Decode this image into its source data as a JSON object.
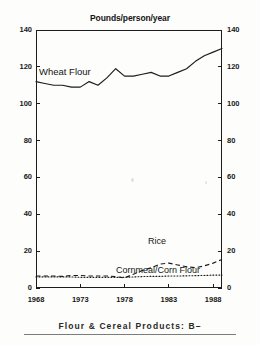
{
  "chart_data": {
    "type": "line",
    "title": "Pounds/person/year",
    "xlabel": "",
    "ylabel": "",
    "xlim": [
      1968,
      1989
    ],
    "ylim": [
      0,
      140
    ],
    "grid": false,
    "legend_position": "inline-annotations",
    "x_ticks": [
      "1968",
      "1973",
      "1978",
      "1983",
      "1988"
    ],
    "x_tick_values": [
      1968,
      1973,
      1978,
      1983,
      1988
    ],
    "y_ticks": [
      "0",
      "20",
      "40",
      "60",
      "80",
      "100",
      "120",
      "140"
    ],
    "y_tick_values": [
      0,
      20,
      40,
      60,
      80,
      100,
      120,
      140
    ],
    "y_axis_duplicated_right": true,
    "x": [
      1968,
      1969,
      1970,
      1971,
      1972,
      1973,
      1974,
      1975,
      1976,
      1977,
      1978,
      1979,
      1980,
      1981,
      1982,
      1983,
      1984,
      1985,
      1986,
      1987,
      1988,
      1989
    ],
    "series": [
      {
        "name": "Wheat Flour",
        "style": "solid",
        "color": "#1c1c1c",
        "values": [
          112,
          111,
          110,
          110,
          109,
          109,
          112,
          110,
          114,
          119,
          115,
          115,
          116,
          117,
          115,
          115,
          117,
          119,
          123,
          126,
          128,
          130
        ]
      },
      {
        "name": "Rice",
        "style": "dashed",
        "color": "#1c1c1c",
        "values": [
          6.5,
          6.5,
          6.5,
          6.3,
          6.8,
          6.8,
          6.5,
          6.5,
          6.5,
          6.2,
          5.5,
          7.5,
          9.5,
          11.0,
          13.0,
          13.5,
          12.5,
          11.5,
          11.0,
          12.0,
          13.5,
          15.5
        ]
      },
      {
        "name": "Cornmeal/Corn Flour",
        "style": "dotted",
        "color": "#1c1c1c",
        "values": [
          6.0,
          6.0,
          6.0,
          6.0,
          6.0,
          5.8,
          5.8,
          5.8,
          5.8,
          5.8,
          5.8,
          6.0,
          6.2,
          6.3,
          6.3,
          6.5,
          6.5,
          6.6,
          6.7,
          6.8,
          7.0,
          7.0
        ]
      }
    ],
    "annotations": [
      {
        "text": "Wheat Flour",
        "x": 1969,
        "y": 122
      },
      {
        "text": "Rice",
        "x": 1982,
        "y": 22
      },
      {
        "text": "Cornmeal/Corn Flour",
        "x": 1980,
        "y": 2
      }
    ]
  },
  "caption": {
    "text": "Flour & Cereal Products: B–"
  }
}
